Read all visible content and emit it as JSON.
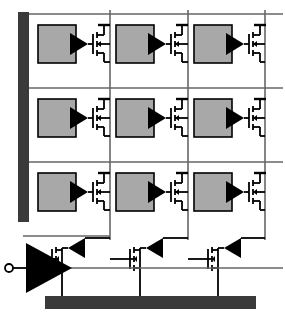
{
  "diagram": {
    "type": "circuit-schematic",
    "canvas": {
      "width": 285,
      "height": 317,
      "background": "#ffffff"
    },
    "colors": {
      "bus_dark": "#3a3a3a",
      "cell_fill": "#a8a8a8",
      "cell_stroke": "#000000",
      "wire": "#555555",
      "symbol": "#000000",
      "background": "#ffffff"
    },
    "select_bus": {
      "label": "row-select-bus",
      "x": 18,
      "y": 12,
      "width": 11,
      "height": 210,
      "color": "#3a3a3a"
    },
    "ground_bus": {
      "label": "ground-bus",
      "x": 45,
      "y": 296,
      "width": 211,
      "height": 13,
      "color": "#3a3a3a"
    },
    "grid": {
      "rows": 3,
      "columns": 3,
      "row_lines_y": [
        14,
        88,
        162
      ],
      "column_lines_x": [
        110,
        188,
        265
      ],
      "row_line_right_x": 283,
      "column_line_bottom_y": 240
    },
    "cells": [
      {
        "id": "cell-r1-c1",
        "row": 1,
        "col": 1,
        "box": {
          "x": 38,
          "y": 25,
          "width": 38,
          "height": 38
        }
      },
      {
        "id": "cell-r1-c2",
        "row": 1,
        "col": 2,
        "box": {
          "x": 116,
          "y": 25,
          "width": 38,
          "height": 38
        }
      },
      {
        "id": "cell-r1-c3",
        "row": 1,
        "col": 3,
        "box": {
          "x": 194,
          "y": 25,
          "width": 38,
          "height": 38
        }
      },
      {
        "id": "cell-r2-c1",
        "row": 2,
        "col": 1,
        "box": {
          "x": 38,
          "y": 99,
          "width": 38,
          "height": 38
        }
      },
      {
        "id": "cell-r2-c2",
        "row": 2,
        "col": 2,
        "box": {
          "x": 116,
          "y": 99,
          "width": 38,
          "height": 38
        }
      },
      {
        "id": "cell-r2-c3",
        "row": 2,
        "col": 3,
        "box": {
          "x": 194,
          "y": 99,
          "width": 38,
          "height": 38
        }
      },
      {
        "id": "cell-r3-c1",
        "row": 3,
        "col": 1,
        "box": {
          "x": 38,
          "y": 173,
          "width": 38,
          "height": 38
        }
      },
      {
        "id": "cell-r3-c2",
        "row": 3,
        "col": 2,
        "box": {
          "x": 116,
          "y": 173,
          "width": 38,
          "height": 38
        }
      },
      {
        "id": "cell-r3-c3",
        "row": 3,
        "col": 3,
        "box": {
          "x": 194,
          "y": 173,
          "width": 38,
          "height": 38
        }
      }
    ],
    "column_drivers": [
      {
        "id": "column-driver-1",
        "col": 1,
        "x": 62,
        "y": 250
      },
      {
        "id": "column-driver-2",
        "col": 2,
        "x": 140,
        "y": 250
      },
      {
        "id": "column-driver-3",
        "col": 3,
        "x": 218,
        "y": 250
      }
    ],
    "input_terminal": {
      "label": "signal-input-terminal",
      "circle": {
        "cx": 9,
        "cy": 268,
        "r": 4
      },
      "lead": {
        "x1": 13,
        "y1": 268,
        "x2": 26,
        "y2": 268
      }
    },
    "input_buffer": {
      "label": "input-buffer-amplifier",
      "points": "26,243 26,293 72,268"
    },
    "symbol_names": {
      "cell_box": "pixel-cell-box",
      "cell_buffer": "cell-buffer-triangle",
      "cell_transistor": "cell-access-transistor",
      "driver_transistor": "driver-nmos-transistor",
      "driver_buffer": "driver-buffer-triangle",
      "select_bus": "row-select-bus",
      "ground_bus": "ground-bus",
      "row_line": "row-line",
      "column_line": "column-line"
    }
  }
}
